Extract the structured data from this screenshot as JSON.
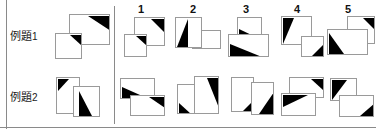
{
  "meta": {
    "width": 376,
    "height": 129,
    "background": "#ffffff",
    "ink": "#000000",
    "outline": "#9a9a9a",
    "rule_color": "#8a8a8a"
  },
  "rows": [
    {
      "id": "row-1",
      "label_text": "例題",
      "label_index": "1",
      "label_full": "例題1"
    },
    {
      "id": "row-2",
      "label_text": "例題",
      "label_index": "2",
      "label_full": "例題2"
    }
  ],
  "column_headers": [
    {
      "label": "1"
    },
    {
      "label": "2"
    },
    {
      "label": "3"
    },
    {
      "label": "4"
    },
    {
      "label": "5"
    }
  ],
  "figures": {
    "row1_prompt": {
      "name": "example-1-prompt-figure",
      "shapes": [
        {
          "x": 14,
          "y": 0,
          "w": 40,
          "h": 30,
          "tri": "top-right",
          "tri_w": 22,
          "tri_h": 14
        },
        {
          "x": 0,
          "y": 19,
          "w": 26,
          "h": 25,
          "tri": "top-right",
          "tri_w": 13,
          "tri_h": 11
        }
      ]
    },
    "row1_opt1": {
      "name": "example-1-option-1-figure",
      "shapes": [
        {
          "x": 10,
          "y": 0,
          "w": 30,
          "h": 28,
          "tri": "top-right",
          "tri_w": 15,
          "tri_h": 13
        },
        {
          "x": 0,
          "y": 17,
          "w": 22,
          "h": 22,
          "tri": "top-right",
          "tri_w": 11,
          "tri_h": 10
        }
      ]
    },
    "row1_opt2": {
      "name": "example-1-option-2-figure",
      "shapes": [
        {
          "x": 17,
          "y": 14,
          "w": 28,
          "h": 18,
          "tri": "none",
          "tri_w": 0,
          "tri_h": 0
        },
        {
          "x": 0,
          "y": 0,
          "w": 26,
          "h": 30,
          "tri": "left-wedge",
          "tri_w": 13,
          "tri_h": 28
        }
      ]
    },
    "row1_opt3": {
      "name": "example-1-option-3-figure",
      "shapes": [
        {
          "x": 9,
          "y": 0,
          "w": 24,
          "h": 22,
          "tri": "bottom-left",
          "tri_w": 18,
          "tri_h": 11
        },
        {
          "x": 0,
          "y": 17,
          "w": 40,
          "h": 22,
          "tri": "bottom-left",
          "tri_w": 30,
          "tri_h": 13
        }
      ]
    },
    "row1_opt4": {
      "name": "example-1-option-4-figure",
      "shapes": [
        {
          "x": 0,
          "y": 0,
          "w": 30,
          "h": 28,
          "tri": "top-left",
          "tri_w": 11,
          "tri_h": 25
        },
        {
          "x": 20,
          "y": 20,
          "w": 22,
          "h": 20,
          "tri": "bottom-right",
          "tri_w": 13,
          "tri_h": 13
        }
      ]
    },
    "row1_opt5": {
      "name": "example-1-option-5-figure",
      "shapes": [
        {
          "x": 20,
          "y": 0,
          "w": 27,
          "h": 27,
          "tri": "top-right",
          "tri_w": 12,
          "tri_h": 12
        },
        {
          "x": 0,
          "y": 13,
          "w": 40,
          "h": 25,
          "tri": "bottom-left",
          "tri_w": 15,
          "tri_h": 22
        }
      ]
    },
    "row2_prompt": {
      "name": "example-2-prompt-figure",
      "shapes": [
        {
          "x": 0,
          "y": 0,
          "w": 23,
          "h": 36,
          "tri": "top-left",
          "tri_w": 11,
          "tri_h": 12
        },
        {
          "x": 17,
          "y": 9,
          "w": 26,
          "h": 30,
          "tri": "bottom-right-wedge",
          "tri_w": 17,
          "tri_h": 24
        }
      ]
    },
    "row2_opt1": {
      "name": "example-2-option-1-figure",
      "shapes": [
        {
          "x": 0,
          "y": 0,
          "w": 34,
          "h": 20,
          "tri": "bottom-left-wedge",
          "tri_w": 26,
          "tri_h": 12
        },
        {
          "x": 10,
          "y": 17,
          "w": 34,
          "h": 20,
          "tri": "top-right-wedge",
          "tri_w": 16,
          "tri_h": 11
        }
      ]
    },
    "row2_opt2": {
      "name": "example-2-option-2-figure",
      "shapes": [
        {
          "x": 0,
          "y": 8,
          "w": 20,
          "h": 29,
          "tri": "bottom-left",
          "tri_w": 12,
          "tri_h": 10
        },
        {
          "x": 17,
          "y": 0,
          "w": 24,
          "h": 37,
          "tri": "top-right-tall",
          "tri_w": 12,
          "tri_h": 30
        }
      ]
    },
    "row2_opt3": {
      "name": "example-2-option-3-figure",
      "shapes": [
        {
          "x": 0,
          "y": 0,
          "w": 22,
          "h": 34,
          "tri": "bottom-right",
          "tri_w": 11,
          "tri_h": 11
        },
        {
          "x": 20,
          "y": 5,
          "w": 22,
          "h": 32,
          "tri": "bottom-right-wedge",
          "tri_w": 14,
          "tri_h": 22
        }
      ]
    },
    "row2_opt4": {
      "name": "example-2-option-4-figure",
      "shapes": [
        {
          "x": 8,
          "y": 0,
          "w": 34,
          "h": 20,
          "tri": "top-right",
          "tri_w": 13,
          "tri_h": 11
        },
        {
          "x": 0,
          "y": 16,
          "w": 34,
          "h": 22,
          "tri": "top-left-wedge",
          "tri_w": 24,
          "tri_h": 12
        }
      ]
    },
    "row2_opt5": {
      "name": "example-2-option-5-figure",
      "shapes": [
        {
          "x": 0,
          "y": 0,
          "w": 26,
          "h": 22,
          "tri": "top-left",
          "tri_w": 15,
          "tri_h": 20
        },
        {
          "x": 9,
          "y": 17,
          "w": 34,
          "h": 21,
          "tri": "bottom-right",
          "tri_w": 14,
          "tri_h": 12
        }
      ]
    }
  },
  "layout": {
    "rules": [
      {
        "name": "left-margin-rule",
        "type": "v",
        "x": 6,
        "y": 0,
        "len": 129
      },
      {
        "name": "divider-rule",
        "type": "v",
        "x": 114,
        "y": 6,
        "len": 118
      },
      {
        "name": "bottom-rule",
        "type": "h",
        "x": 0,
        "y": 127,
        "len": 376
      }
    ],
    "row_label_positions": [
      {
        "x": 10,
        "y": 36
      },
      {
        "x": 10,
        "y": 97
      }
    ],
    "column_header_positions": [
      {
        "x": 134,
        "y": 4
      },
      {
        "x": 186,
        "y": 4
      },
      {
        "x": 239,
        "y": 4
      },
      {
        "x": 290,
        "y": 4
      },
      {
        "x": 341,
        "y": 4
      }
    ],
    "figure_positions": {
      "row1_prompt": {
        "x": 55,
        "y": 14
      },
      "row1_opt1": {
        "x": 124,
        "y": 17
      },
      "row1_opt2": {
        "x": 175,
        "y": 17
      },
      "row1_opt3": {
        "x": 228,
        "y": 17
      },
      "row1_opt4": {
        "x": 281,
        "y": 16
      },
      "row1_opt5": {
        "x": 327,
        "y": 16
      },
      "row2_prompt": {
        "x": 56,
        "y": 77
      },
      "row2_opt1": {
        "x": 120,
        "y": 78
      },
      "row2_opt2": {
        "x": 177,
        "y": 76
      },
      "row2_opt3": {
        "x": 231,
        "y": 77
      },
      "row2_opt4": {
        "x": 281,
        "y": 77
      },
      "row2_opt5": {
        "x": 330,
        "y": 78
      }
    }
  }
}
